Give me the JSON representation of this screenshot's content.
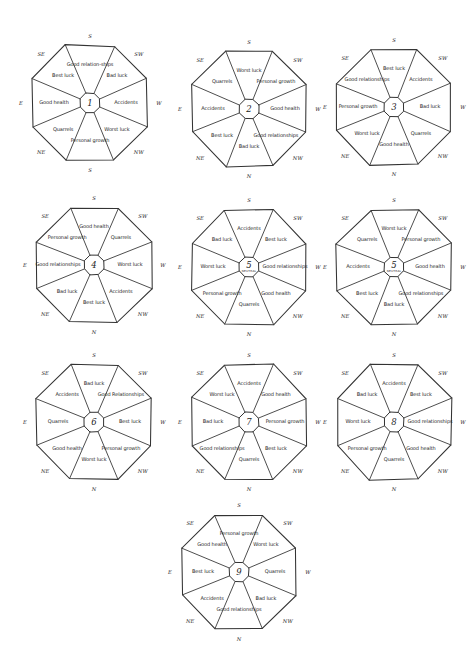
{
  "page": {
    "background_color": "#ffffff",
    "ink_color": "#333333",
    "title": ""
  },
  "geometry": {
    "sector_order": [
      "S",
      "SW",
      "W",
      "NW",
      "N",
      "NE",
      "E",
      "SE"
    ],
    "compass_ring_order": [
      "S",
      "SW",
      "W",
      "NW",
      "N",
      "NE",
      "E",
      "SE"
    ]
  },
  "charts": [
    {
      "id": "octagon-1",
      "center": "1",
      "center_sub": "",
      "x": 14,
      "y": 24,
      "compass": [
        "S",
        "SW",
        "W",
        "NW",
        "S",
        "NE",
        "E",
        "SE"
      ],
      "sectors": [
        {
          "direction": "S",
          "label": "Good relation-ships"
        },
        {
          "direction": "SW",
          "label": "Bad luck"
        },
        {
          "direction": "W",
          "label": "Accidents"
        },
        {
          "direction": "NW",
          "label": "Worst luck"
        },
        {
          "direction": "S",
          "label": "Personal growth"
        },
        {
          "direction": "NE",
          "label": "Quarrels"
        },
        {
          "direction": "E",
          "label": "Good health"
        },
        {
          "direction": "SE",
          "label": "Best luck"
        }
      ]
    },
    {
      "id": "octagon-2",
      "center": "2",
      "center_sub": "",
      "x": 173,
      "y": 30,
      "compass": [
        "S",
        "SW",
        "W",
        "NW",
        "N",
        "NE",
        "E",
        "SE"
      ],
      "sectors": [
        {
          "direction": "S",
          "label": "Worst luck"
        },
        {
          "direction": "SW",
          "label": "Personal growth"
        },
        {
          "direction": "W",
          "label": "Good health"
        },
        {
          "direction": "NW",
          "label": "Good relationships"
        },
        {
          "direction": "N",
          "label": "Bad luck"
        },
        {
          "direction": "NE",
          "label": "Best luck"
        },
        {
          "direction": "E",
          "label": "Accidents"
        },
        {
          "direction": "SE",
          "label": "Quarrels"
        }
      ]
    },
    {
      "id": "octagon-3",
      "center": "3",
      "center_sub": "",
      "x": 318,
      "y": 28,
      "compass": [
        "S",
        "SW",
        "W",
        "NW",
        "N",
        "NE",
        "E",
        "SE"
      ],
      "sectors": [
        {
          "direction": "S",
          "label": "Best luck"
        },
        {
          "direction": "SW",
          "label": "Accidents"
        },
        {
          "direction": "W",
          "label": "Bad luck"
        },
        {
          "direction": "NW",
          "label": "Quarrels"
        },
        {
          "direction": "N",
          "label": "Good health"
        },
        {
          "direction": "NE",
          "label": "Worst luck"
        },
        {
          "direction": "E",
          "label": "Personal growth"
        },
        {
          "direction": "SE",
          "label": "Good relationships"
        }
      ]
    },
    {
      "id": "octagon-4",
      "center": "4",
      "center_sub": "",
      "x": 18,
      "y": 186,
      "compass": [
        "S",
        "SW",
        "W",
        "NW",
        "N",
        "NE",
        "E",
        "SE"
      ],
      "sectors": [
        {
          "direction": "S",
          "label": "Good health"
        },
        {
          "direction": "SW",
          "label": "Quarrels"
        },
        {
          "direction": "W",
          "label": "Worst luck"
        },
        {
          "direction": "NW",
          "label": "Accidents"
        },
        {
          "direction": "N",
          "label": "Best luck"
        },
        {
          "direction": "NE",
          "label": "Bad luck"
        },
        {
          "direction": "E",
          "label": "Good relationships"
        },
        {
          "direction": "SE",
          "label": "Personal growth"
        }
      ]
    },
    {
      "id": "octagon-5",
      "center": "5",
      "center_sub": "NEUTRAL",
      "x": 173,
      "y": 188,
      "compass": [
        "S",
        "SW",
        "W",
        "NW",
        "N",
        "NE",
        "E",
        "SE"
      ],
      "sectors": [
        {
          "direction": "S",
          "label": "Accidents"
        },
        {
          "direction": "SW",
          "label": "Best luck"
        },
        {
          "direction": "W",
          "label": "Good relationships"
        },
        {
          "direction": "NW",
          "label": "Good health"
        },
        {
          "direction": "N",
          "label": "Quarrels"
        },
        {
          "direction": "NE",
          "label": "Personal growth"
        },
        {
          "direction": "E",
          "label": "Worst luck"
        },
        {
          "direction": "SE",
          "label": "Bad luck"
        }
      ]
    },
    {
      "id": "octagon-5b",
      "center": "5",
      "center_sub": "NEUTRAL",
      "x": 318,
      "y": 188,
      "compass": [
        "S",
        "SW",
        "W",
        "NW",
        "N",
        "NE",
        "E",
        "SE"
      ],
      "sectors": [
        {
          "direction": "S",
          "label": "Worst luck"
        },
        {
          "direction": "SW",
          "label": "Personal growth"
        },
        {
          "direction": "W",
          "label": "Good health"
        },
        {
          "direction": "NW",
          "label": "Good relationships"
        },
        {
          "direction": "N",
          "label": "Bad luck"
        },
        {
          "direction": "NE",
          "label": "Best luck"
        },
        {
          "direction": "E",
          "label": "Accidents"
        },
        {
          "direction": "SE",
          "label": "Quarrels"
        }
      ]
    },
    {
      "id": "octagon-6",
      "center": "6",
      "center_sub": "",
      "x": 18,
      "y": 343,
      "compass": [
        "S",
        "SW",
        "W",
        "NW",
        "N",
        "NE",
        "E",
        "SE"
      ],
      "sectors": [
        {
          "direction": "S",
          "label": "Bad luck"
        },
        {
          "direction": "SW",
          "label": "Good Relationships"
        },
        {
          "direction": "W",
          "label": "Best luck"
        },
        {
          "direction": "NW",
          "label": "Personal growth"
        },
        {
          "direction": "N",
          "label": "Worst luck"
        },
        {
          "direction": "NE",
          "label": "Good health"
        },
        {
          "direction": "E",
          "label": "Quarrels"
        },
        {
          "direction": "SE",
          "label": "Accidents"
        }
      ]
    },
    {
      "id": "octagon-7",
      "center": "7",
      "center_sub": "",
      "x": 173,
      "y": 343,
      "compass": [
        "S",
        "SW",
        "W",
        "NW",
        "N",
        "NE",
        "E",
        "SE"
      ],
      "sectors": [
        {
          "direction": "S",
          "label": "Accidents"
        },
        {
          "direction": "SW",
          "label": "Good health"
        },
        {
          "direction": "W",
          "label": "Personal growth"
        },
        {
          "direction": "NW",
          "label": "Best luck"
        },
        {
          "direction": "N",
          "label": "Quarrels"
        },
        {
          "direction": "NE",
          "label": "Good relationships"
        },
        {
          "direction": "E",
          "label": "Bad luck"
        },
        {
          "direction": "SE",
          "label": "Worst luck"
        }
      ]
    },
    {
      "id": "octagon-8",
      "center": "8",
      "center_sub": "",
      "x": 318,
      "y": 343,
      "compass": [
        "S",
        "SW",
        "W",
        "NW",
        "N",
        "NE",
        "E",
        "SE"
      ],
      "sectors": [
        {
          "direction": "S",
          "label": "Accidents"
        },
        {
          "direction": "SW",
          "label": "Best luck"
        },
        {
          "direction": "W",
          "label": "Good relationships"
        },
        {
          "direction": "NW",
          "label": "Good health"
        },
        {
          "direction": "N",
          "label": "Quarrels"
        },
        {
          "direction": "NE",
          "label": "Personal growth"
        },
        {
          "direction": "E",
          "label": "Worst luck"
        },
        {
          "direction": "SE",
          "label": "Bad luck"
        }
      ]
    },
    {
      "id": "octagon-9",
      "center": "9",
      "center_sub": "",
      "x": 163,
      "y": 493,
      "compass": [
        "S",
        "SW",
        "W",
        "NW",
        "N",
        "NE",
        "E",
        "SE"
      ],
      "sectors": [
        {
          "direction": "S",
          "label": "Personal growth"
        },
        {
          "direction": "SW",
          "label": "Worst luck"
        },
        {
          "direction": "W",
          "label": "Quarrels"
        },
        {
          "direction": "NW",
          "label": "Bad luck"
        },
        {
          "direction": "N",
          "label": "Good relationships"
        },
        {
          "direction": "NE",
          "label": "Accidents"
        },
        {
          "direction": "E",
          "label": "Best luck"
        },
        {
          "direction": "SE",
          "label": "Good health"
        }
      ]
    }
  ]
}
